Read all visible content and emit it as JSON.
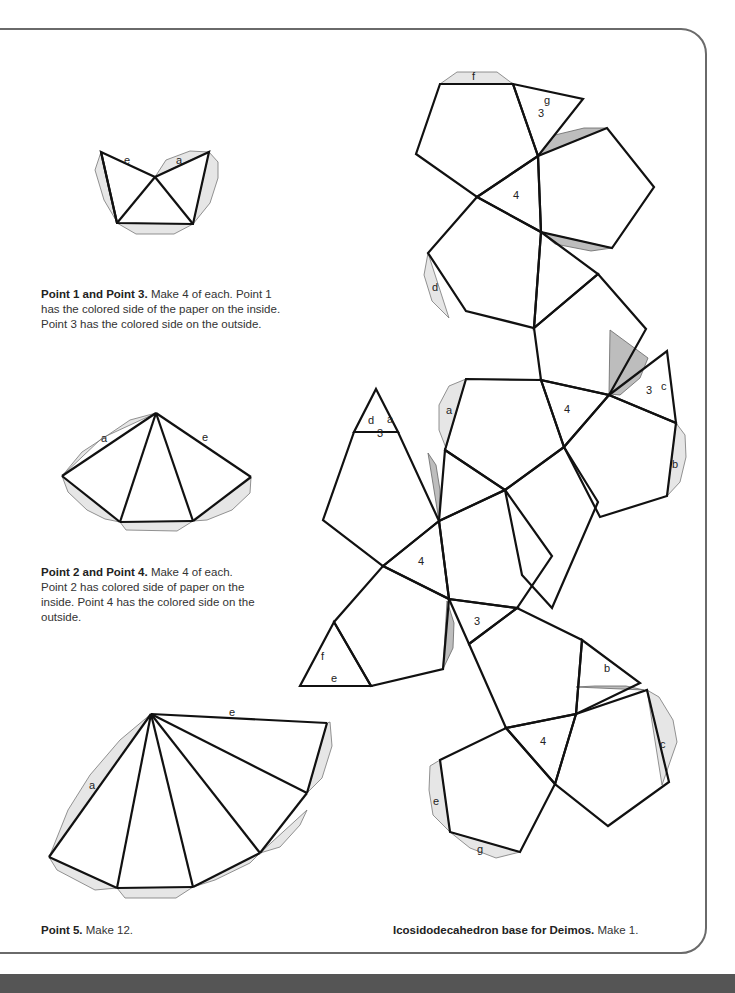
{
  "captions": {
    "point13": {
      "bold": "Point 1 and Point 3.",
      "text": " Make 4 of each. Point 1 has the colored side of the paper on the inside. Point 3 has the colored side on the outside."
    },
    "point24": {
      "bold": "Point 2 and Point 4.",
      "text": " Make 4 of each. Point 2 has colored side of paper on the inside. Point 4 has the colored side on the outside."
    },
    "point5": {
      "bold": "Point 5.",
      "text": " Make 12."
    },
    "base": {
      "bold": "Icosidodecahedron base for Deimos.",
      "text": " Make 1."
    }
  },
  "labels": {
    "p13_e": "e",
    "p13_a": "a",
    "p24_a": "a",
    "p24_e": "e",
    "p5_e": "e",
    "p5_a": "a",
    "net_f": "f",
    "net_g_top": "g",
    "net_3_top": "3",
    "net_4_top": "4",
    "net_d": "d",
    "net_a_mid": "a",
    "net_4_mid": "4",
    "net_3_right": "3",
    "net_c_right": "c",
    "net_b_right": "b",
    "net_d_left": "d",
    "net_a_left": "a",
    "net_3_left": "3",
    "net_4_left": "4",
    "net_f_low": "f",
    "net_e_low": "e",
    "net_3_low": "3",
    "net_b_low": "b",
    "net_4_bottom": "4",
    "net_c_bottom": "c",
    "net_e_bottom": "e",
    "net_g_bottom": "g"
  },
  "colors": {
    "stroke": "#111111",
    "tab_fill": "#e6e6e6",
    "tab_dark": "#bdbdbd",
    "frame": "#6a6a6a",
    "band": "#555555"
  }
}
